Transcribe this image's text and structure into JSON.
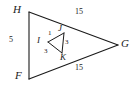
{
  "figure": {
    "type": "geometry-diagram",
    "background_color": "#ffffff",
    "stroke_color": "#1a1a1a",
    "outer_triangle": {
      "name": "HFG",
      "vertices": [
        {
          "label": "H",
          "x": 29,
          "y": 12
        },
        {
          "label": "F",
          "x": 29,
          "y": 79
        },
        {
          "label": "G",
          "x": 118,
          "y": 45
        }
      ],
      "sides": [
        {
          "name": "HF",
          "label": "5",
          "label_x": 10,
          "label_y": 40
        },
        {
          "name": "HG",
          "label": "15",
          "label_x": 79,
          "label_y": 13
        },
        {
          "name": "FG",
          "label": "15",
          "label_x": 79,
          "label_y": 68
        }
      ]
    },
    "inner_triangle": {
      "name": "IJK",
      "vertices": [
        {
          "label": "I",
          "x": 48,
          "y": 42
        },
        {
          "label": "J",
          "x": 64,
          "y": 33
        },
        {
          "label": "K",
          "x": 62,
          "y": 53
        }
      ],
      "sides": [
        {
          "name": "IJ",
          "label": "1",
          "label_x": 52,
          "label_y": 33
        },
        {
          "name": "JK",
          "label": "3",
          "label_x": 67,
          "label_y": 43
        },
        {
          "name": "IK",
          "label": "3",
          "label_x": 47,
          "label_y": 52
        }
      ]
    },
    "vertex_labels": {
      "H": "H",
      "F": "F",
      "G": "G",
      "I": "I",
      "J": "J",
      "K": "K"
    },
    "measure_labels": {
      "left_side": "5",
      "top_side": "15",
      "bottom_side": "15",
      "inner_top": "1",
      "inner_right": "3",
      "inner_left": "3"
    }
  }
}
